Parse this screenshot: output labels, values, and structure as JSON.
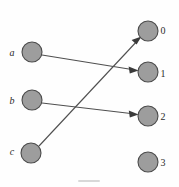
{
  "figure": {
    "width": 179,
    "height": 187,
    "background_color": "#fefefe",
    "node_fill_color": "#9d9d9d",
    "node_stroke_color": "#4a4a4a",
    "edge_color": "#4f4f4f"
  },
  "left_nodes": [
    {
      "label": "a",
      "cx": 32,
      "cy": 52,
      "r": 10,
      "label_x": 12,
      "label_y": 53
    },
    {
      "label": "b",
      "cx": 32,
      "cy": 100,
      "r": 10,
      "label_x": 12,
      "label_y": 101
    },
    {
      "label": "c",
      "cx": 31,
      "cy": 153,
      "r": 10,
      "label_x": 12,
      "label_y": 152
    }
  ],
  "right_nodes": [
    {
      "label": "0",
      "cx": 148,
      "cy": 31,
      "r": 10,
      "label_x": 162,
      "label_y": 30
    },
    {
      "label": "1",
      "cx": 148,
      "cy": 72,
      "r": 10,
      "label_x": 162,
      "label_y": 74
    },
    {
      "label": "2",
      "cx": 148,
      "cy": 116,
      "r": 10,
      "label_x": 162,
      "label_y": 118
    },
    {
      "label": "3",
      "cx": 148,
      "cy": 162,
      "r": 10,
      "label_x": 162,
      "label_y": 164
    }
  ],
  "edges": [
    {
      "from": "a",
      "to": "1",
      "x1": 42,
      "y1": 55,
      "x2": 136,
      "y2": 70
    },
    {
      "from": "b",
      "to": "2",
      "x1": 42,
      "y1": 103,
      "x2": 136,
      "y2": 114
    },
    {
      "from": "c",
      "to": "0",
      "x1": 39,
      "y1": 146,
      "x2": 140,
      "y2": 38
    }
  ],
  "graph_data": {
    "type": "bipartite-mapping",
    "domain_labels": [
      "a",
      "b",
      "c"
    ],
    "codomain_labels": [
      "0",
      "1",
      "2",
      "3"
    ],
    "mapping": [
      {
        "source": "a",
        "target": "1"
      },
      {
        "source": "b",
        "target": "2"
      },
      {
        "source": "c",
        "target": "0"
      }
    ],
    "unmapped_targets": [
      "3"
    ],
    "directed": true,
    "arrowheads": true
  }
}
